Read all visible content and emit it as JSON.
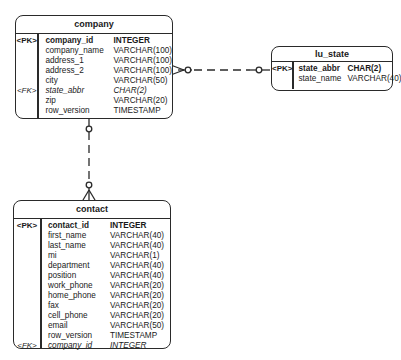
{
  "entities": {
    "company": {
      "title": "company",
      "keys": [
        "<PK>",
        "",
        "",
        "",
        "",
        "<FK>",
        "",
        ""
      ],
      "columns": [
        {
          "name": "company_id",
          "type": "INTEGER"
        },
        {
          "name": "company_name",
          "type": "VARCHAR(100)"
        },
        {
          "name": "address_1",
          "type": "VARCHAR(100)"
        },
        {
          "name": "address_2",
          "type": "VARCHAR(100)"
        },
        {
          "name": "city",
          "type": "VARCHAR(50)"
        },
        {
          "name": "state_abbr",
          "type": "CHAR(2)"
        },
        {
          "name": "zip",
          "type": "VARCHAR(20)"
        },
        {
          "name": "row_version",
          "type": "TIMESTAMP"
        }
      ]
    },
    "lu_state": {
      "title": "lu_state",
      "keys": [
        "<PK>",
        ""
      ],
      "columns": [
        {
          "name": "state_abbr",
          "type": "CHAR(2)"
        },
        {
          "name": "state_name",
          "type": "VARCHAR(40)"
        }
      ]
    },
    "contact": {
      "title": "contact",
      "keys": [
        "<PK>",
        "",
        "",
        "",
        "",
        "",
        "",
        "",
        "",
        "",
        "",
        "",
        "<FK>"
      ],
      "columns": [
        {
          "name": "contact_id",
          "type": "INTEGER"
        },
        {
          "name": "first_name",
          "type": "VARCHAR(40)"
        },
        {
          "name": "last_name",
          "type": "VARCHAR(40)"
        },
        {
          "name": "mi",
          "type": "VARCHAR(1)"
        },
        {
          "name": "department",
          "type": "VARCHAR(40)"
        },
        {
          "name": "position",
          "type": "VARCHAR(40)"
        },
        {
          "name": "work_phone",
          "type": "VARCHAR(20)"
        },
        {
          "name": "home_phone",
          "type": "VARCHAR(20)"
        },
        {
          "name": "fax",
          "type": "VARCHAR(20)"
        },
        {
          "name": "cell_phone",
          "type": "VARCHAR(20)"
        },
        {
          "name": "email",
          "type": "VARCHAR(50)"
        },
        {
          "name": "row_version",
          "type": "TIMESTAMP"
        },
        {
          "name": "company_id",
          "type": "INTEGER"
        }
      ]
    }
  },
  "relationships": [
    {
      "from": "lu_state",
      "to": "company",
      "from_card": "one-optional",
      "to_card": "many-optional",
      "style": "dashed"
    },
    {
      "from": "company",
      "to": "contact",
      "from_card": "one-optional",
      "to_card": "many-optional",
      "style": "dashed"
    }
  ]
}
